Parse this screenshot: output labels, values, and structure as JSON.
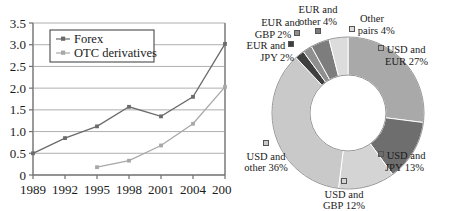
{
  "chart_data": [
    {
      "type": "line",
      "title": "",
      "xlabel": "",
      "ylabel": "",
      "categories": [
        "1989",
        "1992",
        "1995",
        "1998",
        "2001",
        "2004",
        "2007"
      ],
      "ylim": [
        0,
        3.5
      ],
      "yticks": [
        "0",
        "0.5",
        "1.0",
        "1.5",
        "2.0",
        "2.5",
        "3.0",
        "3.5"
      ],
      "ytick_values": [
        0,
        0.5,
        1.0,
        1.5,
        2.0,
        2.5,
        3.0,
        3.5
      ],
      "grid": true,
      "legend_position": "top-left-inside",
      "series": [
        {
          "name": "Forex",
          "color": "#6b6b6b",
          "values": [
            0.5,
            0.85,
            1.12,
            1.57,
            1.35,
            1.8,
            3.02
          ]
        },
        {
          "name": "OTC derivatives",
          "color": "#a8a8a8",
          "values": [
            null,
            null,
            0.18,
            0.33,
            0.68,
            1.18,
            2.03
          ]
        }
      ]
    },
    {
      "type": "pie",
      "subtype": "doughnut",
      "title": "",
      "labels": [
        "USD and EUR 27%",
        "USD and JPY 13%",
        "USD and GBP 12%",
        "USD and other 36%",
        "EUR and JPY 2%",
        "EUR and GBP 2%",
        "EUR and other 4%",
        "Other pairs 4%"
      ],
      "values": [
        27,
        13,
        12,
        36,
        2,
        2,
        4,
        4
      ],
      "colors": [
        "#a9a9a9",
        "#6e6e6e",
        "#d4d4d4",
        "#c9c9c9",
        "#3f3f3f",
        "#8f8f8f",
        "#7d7d7d",
        "#dcdcdc"
      ]
    }
  ],
  "line_chart": {
    "legend": {
      "forex_label": "Forex",
      "otc_label": "OTC derivatives"
    },
    "yticks": {
      "t0": "0",
      "t1": "0.5",
      "t2": "1.0",
      "t3": "1.5",
      "t4": "2.0",
      "t5": "2.5",
      "t6": "3.0",
      "t7": "3.5"
    },
    "xticks": {
      "t0": "1989",
      "t1": "1992",
      "t2": "1995",
      "t3": "1998",
      "t4": "2001",
      "t5": "2004",
      "t6": "2007"
    }
  },
  "pie_chart": {
    "labels": {
      "usd_eur_l1": "USD and",
      "usd_eur_l2": "EUR 27%",
      "usd_jpy_l1": "USD and",
      "usd_jpy_l2": "JPY 13%",
      "usd_gbp_l1": "USD and",
      "usd_gbp_l2": "GBP 12%",
      "usd_other_l1": "USD and",
      "usd_other_l2": "other 36%",
      "eur_jpy_l1": "EUR and",
      "eur_jpy_l2": "JPY 2%",
      "eur_gbp_l1": "EUR and",
      "eur_gbp_l2": "GBP 2%",
      "eur_other_l1": "EUR and",
      "eur_other_l2": "other 4%",
      "other_pairs_l1": "Other",
      "other_pairs_l2": "pairs 4%"
    }
  }
}
